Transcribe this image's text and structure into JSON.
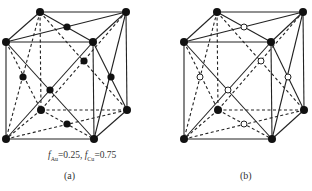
{
  "panels": [
    {
      "id": "a",
      "label": "(a)",
      "fraction_text": {
        "f1_symbol": "f",
        "f1_sub": "Au",
        "f1_value": "=0.25, ",
        "f2_symbol": "f",
        "f2_sub": "Cu",
        "f2_value": "=0.75"
      },
      "corner_atoms": "filled",
      "face_center_atoms": "filled",
      "hidden_corner_atom": "filled"
    },
    {
      "id": "b",
      "label": "(b)",
      "corner_atoms": "filled",
      "face_center_atoms": "hollow",
      "hidden_corner_atom": "filled"
    }
  ],
  "colors": {
    "line": "#222222",
    "atom_filled": "#111111",
    "atom_hollow_fill": "#ffffff"
  }
}
